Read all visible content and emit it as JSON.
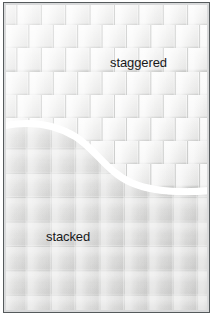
{
  "diagram": {
    "regions": [
      {
        "id": "staggered",
        "label": "staggered",
        "pattern": "brick-bond",
        "description": "Upper field: rows of square tiles offset by half a tile each row.",
        "tile_width_px": 24.4,
        "tile_height_px": 23.2,
        "row_offset_px": 12.2,
        "fill_color": "#ececeb",
        "grout_color": "#96988f"
      },
      {
        "id": "stacked",
        "label": "stacked",
        "pattern": "grid-aligned",
        "description": "Lower field: square tiles aligned in straight columns and rows.",
        "tile_width_px": 24.4,
        "tile_height_px": 24.4,
        "row_offset_px": 0,
        "fill_color": "#dededd",
        "grout_color": "#8c8e8c"
      }
    ],
    "divider": {
      "name": "s-curve-divider",
      "color": "#ffffff",
      "stroke_width_px": 7,
      "shape": "s-curve",
      "start_y_px": 124,
      "end_y_px": 190
    },
    "frame": {
      "border_color": "#555a5c",
      "inner_margin_color": "#d9dadb",
      "background_color": "#ffffff"
    }
  }
}
